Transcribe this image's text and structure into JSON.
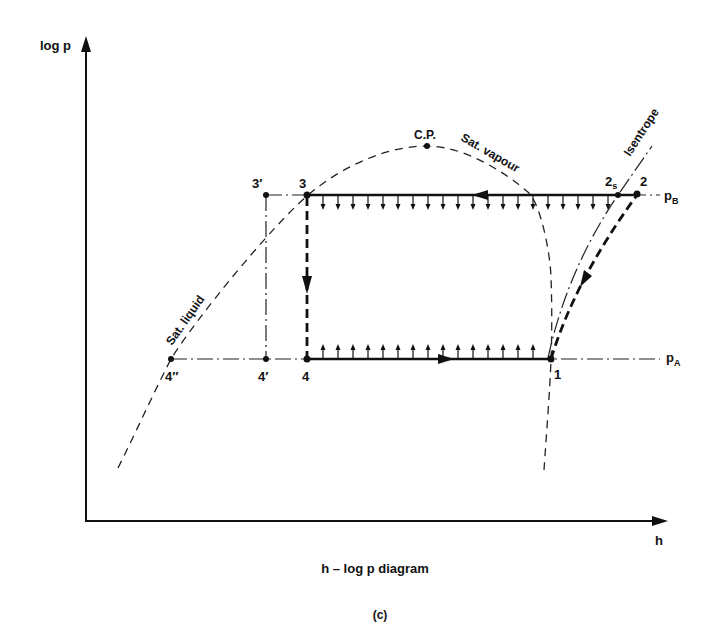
{
  "figure": {
    "y_axis_label": "log p",
    "x_axis_label": "h",
    "caption": "h – log p  diagram",
    "panel_label": "(c)"
  },
  "curves": {
    "sat_liquid": "Sat. liquid",
    "sat_vapour": "Sat. vapour",
    "isentrope": "Isentrope",
    "critical_point": "C.P."
  },
  "pressure_levels": {
    "high": {
      "symbol": "p",
      "subscript": "B"
    },
    "low": {
      "symbol": "p",
      "subscript": "A"
    }
  },
  "state_points": {
    "p3_prime": "3′",
    "p3": "3",
    "p2s": {
      "main": "2",
      "subscript": "s"
    },
    "p2": "2",
    "p4_dprime": "4″",
    "p4_prime": "4′",
    "p4": "4",
    "p1": "1"
  },
  "heat_arrows": {
    "upper": {
      "count": 20,
      "x_start": 323,
      "step": 15,
      "y": 196,
      "direction": "down"
    },
    "lower": {
      "count": 15,
      "x_start": 323,
      "step": 15,
      "y": 358,
      "direction": "up"
    }
  },
  "chart_data": {
    "type": "diagram",
    "title": "h – log p diagram",
    "xlabel": "h",
    "ylabel": "log p",
    "process_path": [
      "1",
      "2",
      "3",
      "4",
      "1"
    ],
    "processes": [
      {
        "from": "1",
        "to": "2",
        "style": "thick dashed",
        "meaning": "compression"
      },
      {
        "from": "2",
        "to": "3",
        "style": "thick solid",
        "meaning": "heat rejection at p_B"
      },
      {
        "from": "3",
        "to": "4",
        "style": "thick dashed",
        "meaning": "throttling"
      },
      {
        "from": "4",
        "to": "1",
        "style": "thick solid",
        "meaning": "heat absorption at p_A"
      }
    ],
    "reference_points": [
      "3′",
      "4′",
      "4″",
      "2s",
      "C.P."
    ]
  }
}
